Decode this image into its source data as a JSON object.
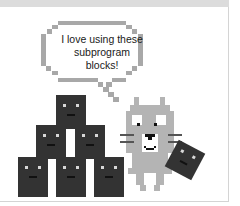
{
  "speech_bubble": {
    "line1": "I love using these",
    "line2": "subprogram",
    "line3": "blocks!"
  },
  "colors": {
    "block": "#333333",
    "cat": "#b4b4b4",
    "bubble_outline": "#a8a8a8",
    "header_band": "#dcdcdc"
  },
  "illustration": {
    "blocks_count": 7,
    "characters": [
      "block-pyramid",
      "pixel-cat",
      "tilted-block"
    ]
  }
}
